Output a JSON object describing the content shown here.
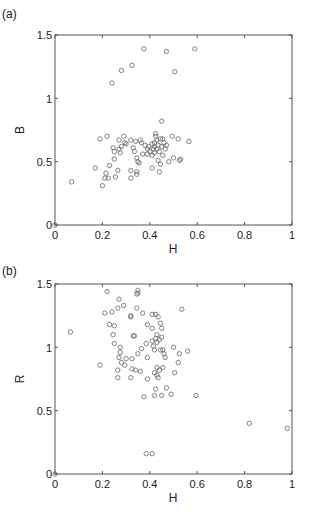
{
  "figure": {
    "panels": [
      {
        "label": "(a)",
        "xlabel": "H",
        "ylabel": "B",
        "xticks": [
          "0",
          "0.2",
          "0.4",
          "0.6",
          "0.8",
          "1"
        ],
        "yticks": [
          "0",
          "0.5",
          "1",
          "1.5"
        ]
      },
      {
        "label": "(b)",
        "xlabel": "H",
        "ylabel": "R",
        "xticks": [
          "0",
          "0.2",
          "0.4",
          "0.6",
          "0.8",
          "1"
        ],
        "yticks": [
          "0",
          "0.5",
          "1",
          "1.5"
        ]
      }
    ]
  },
  "chart_data": [
    {
      "type": "scatter",
      "title": "(a)",
      "xlabel": "H",
      "ylabel": "B",
      "xlim": [
        0,
        1
      ],
      "ylim": [
        0,
        1.5
      ],
      "xticks": [
        0,
        0.2,
        0.4,
        0.6,
        0.8,
        1
      ],
      "yticks": [
        0,
        0.5,
        1,
        1.5
      ],
      "grid": false,
      "marker": "open-circle",
      "points": [
        [
          0.0,
          0.0
        ],
        [
          0.07,
          0.34
        ],
        [
          0.17,
          0.45
        ],
        [
          0.19,
          0.68
        ],
        [
          0.2,
          0.31
        ],
        [
          0.21,
          0.37
        ],
        [
          0.215,
          0.41
        ],
        [
          0.22,
          0.7
        ],
        [
          0.225,
          0.37
        ],
        [
          0.23,
          0.47
        ],
        [
          0.245,
          0.61
        ],
        [
          0.25,
          0.58
        ],
        [
          0.25,
          0.52
        ],
        [
          0.255,
          0.38
        ],
        [
          0.265,
          0.43
        ],
        [
          0.27,
          0.67
        ],
        [
          0.27,
          0.6
        ],
        [
          0.275,
          0.57
        ],
        [
          0.28,
          0.62
        ],
        [
          0.29,
          0.7
        ],
        [
          0.295,
          0.65
        ],
        [
          0.3,
          0.64
        ],
        [
          0.32,
          0.67
        ],
        [
          0.32,
          0.43
        ],
        [
          0.32,
          0.37
        ],
        [
          0.33,
          0.61
        ],
        [
          0.335,
          0.58
        ],
        [
          0.34,
          0.66
        ],
        [
          0.345,
          0.53
        ],
        [
          0.345,
          0.42
        ],
        [
          0.345,
          0.4
        ],
        [
          0.35,
          0.5
        ],
        [
          0.355,
          0.49
        ],
        [
          0.36,
          0.67
        ],
        [
          0.365,
          0.65
        ],
        [
          0.37,
          0.56
        ],
        [
          0.38,
          0.63
        ],
        [
          0.39,
          0.6
        ],
        [
          0.39,
          0.56
        ],
        [
          0.395,
          0.62
        ],
        [
          0.4,
          0.58
        ],
        [
          0.41,
          0.64
        ],
        [
          0.41,
          0.55
        ],
        [
          0.41,
          0.45
        ],
        [
          0.415,
          0.6
        ],
        [
          0.42,
          0.65
        ],
        [
          0.42,
          0.57
        ],
        [
          0.42,
          0.62
        ],
        [
          0.425,
          0.7
        ],
        [
          0.425,
          0.72
        ],
        [
          0.43,
          0.67
        ],
        [
          0.43,
          0.6
        ],
        [
          0.435,
          0.63
        ],
        [
          0.435,
          0.51
        ],
        [
          0.44,
          0.42
        ],
        [
          0.44,
          0.58
        ],
        [
          0.445,
          0.68
        ],
        [
          0.445,
          0.48
        ],
        [
          0.45,
          0.62
        ],
        [
          0.45,
          0.82
        ],
        [
          0.455,
          0.55
        ],
        [
          0.455,
          0.68
        ],
        [
          0.46,
          0.65
        ],
        [
          0.465,
          0.6
        ],
        [
          0.47,
          0.63
        ],
        [
          0.48,
          0.5
        ],
        [
          0.495,
          0.7
        ],
        [
          0.5,
          0.53
        ],
        [
          0.52,
          0.68
        ],
        [
          0.525,
          0.51
        ],
        [
          0.53,
          0.52
        ],
        [
          0.565,
          0.66
        ],
        [
          0.24,
          1.12
        ],
        [
          0.28,
          1.22
        ],
        [
          0.325,
          1.26
        ],
        [
          0.375,
          1.39
        ],
        [
          0.47,
          1.37
        ],
        [
          0.505,
          1.21
        ],
        [
          0.59,
          1.39
        ]
      ]
    },
    {
      "type": "scatter",
      "title": "(b)",
      "xlabel": "H",
      "ylabel": "R",
      "xlim": [
        0,
        1
      ],
      "ylim": [
        0,
        1.5
      ],
      "xticks": [
        0,
        0.2,
        0.4,
        0.6,
        0.8,
        1
      ],
      "yticks": [
        0,
        0.5,
        1,
        1.5
      ],
      "grid": false,
      "marker": "open-circle",
      "points": [
        [
          0.0,
          0.0
        ],
        [
          0.065,
          1.12
        ],
        [
          0.19,
          0.86
        ],
        [
          0.21,
          1.27
        ],
        [
          0.22,
          1.44
        ],
        [
          0.23,
          1.18
        ],
        [
          0.24,
          1.28
        ],
        [
          0.245,
          1.1
        ],
        [
          0.25,
          1.17
        ],
        [
          0.25,
          1.03
        ],
        [
          0.265,
          1.31
        ],
        [
          0.265,
          0.82
        ],
        [
          0.265,
          0.76
        ],
        [
          0.27,
          1.38
        ],
        [
          0.27,
          0.92
        ],
        [
          0.275,
          1.0
        ],
        [
          0.275,
          0.96
        ],
        [
          0.28,
          0.88
        ],
        [
          0.29,
          1.33
        ],
        [
          0.295,
          0.86
        ],
        [
          0.3,
          0.91
        ],
        [
          0.32,
          1.24
        ],
        [
          0.32,
          1.25
        ],
        [
          0.32,
          0.76
        ],
        [
          0.325,
          0.91
        ],
        [
          0.325,
          0.83
        ],
        [
          0.33,
          1.09
        ],
        [
          0.335,
          1.09
        ],
        [
          0.34,
          0.82
        ],
        [
          0.345,
          1.31
        ],
        [
          0.345,
          1.42
        ],
        [
          0.35,
          1.43
        ],
        [
          0.35,
          1.45
        ],
        [
          0.35,
          0.95
        ],
        [
          0.36,
          0.81
        ],
        [
          0.365,
          0.99
        ],
        [
          0.37,
          1.27
        ],
        [
          0.375,
          0.61
        ],
        [
          0.385,
          1.03
        ],
        [
          0.39,
          0.92
        ],
        [
          0.39,
          1.18
        ],
        [
          0.39,
          0.75
        ],
        [
          0.41,
          1.26
        ],
        [
          0.41,
          1.15
        ],
        [
          0.41,
          1.05
        ],
        [
          0.415,
          1.01
        ],
        [
          0.42,
          0.98
        ],
        [
          0.42,
          0.8
        ],
        [
          0.42,
          0.62
        ],
        [
          0.425,
          1.26
        ],
        [
          0.425,
          1.07
        ],
        [
          0.425,
          0.67
        ],
        [
          0.43,
          1.1
        ],
        [
          0.43,
          0.84
        ],
        [
          0.43,
          0.78
        ],
        [
          0.43,
          1.04
        ],
        [
          0.435,
          1.24
        ],
        [
          0.435,
          0.76
        ],
        [
          0.44,
          0.82
        ],
        [
          0.44,
          1.06
        ],
        [
          0.445,
          1.19
        ],
        [
          0.445,
          0.98
        ],
        [
          0.45,
          1.15
        ],
        [
          0.45,
          1.08
        ],
        [
          0.45,
          0.62
        ],
        [
          0.455,
          0.98
        ],
        [
          0.455,
          0.84
        ],
        [
          0.46,
          0.95
        ],
        [
          0.465,
          0.92
        ],
        [
          0.47,
          0.68
        ],
        [
          0.49,
          0.63
        ],
        [
          0.5,
          1.0
        ],
        [
          0.505,
          0.8
        ],
        [
          0.52,
          0.88
        ],
        [
          0.525,
          0.95
        ],
        [
          0.535,
          1.3
        ],
        [
          0.56,
          0.97
        ],
        [
          0.595,
          0.62
        ],
        [
          0.385,
          0.16
        ],
        [
          0.41,
          0.16
        ],
        [
          0.82,
          0.4
        ],
        [
          0.98,
          0.36
        ]
      ]
    }
  ]
}
